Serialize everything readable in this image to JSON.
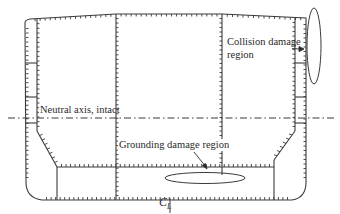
{
  "figure": {
    "labels": {
      "neutral_axis": "Neutral axis, intact",
      "grounding": "Grounding damage region",
      "collision_line1": "Collision damage",
      "collision_line2": "region",
      "centerline_main": "C",
      "centerline_sub": "L"
    },
    "colors": {
      "line": "#3a3a3a",
      "background": "#ffffff"
    }
  }
}
